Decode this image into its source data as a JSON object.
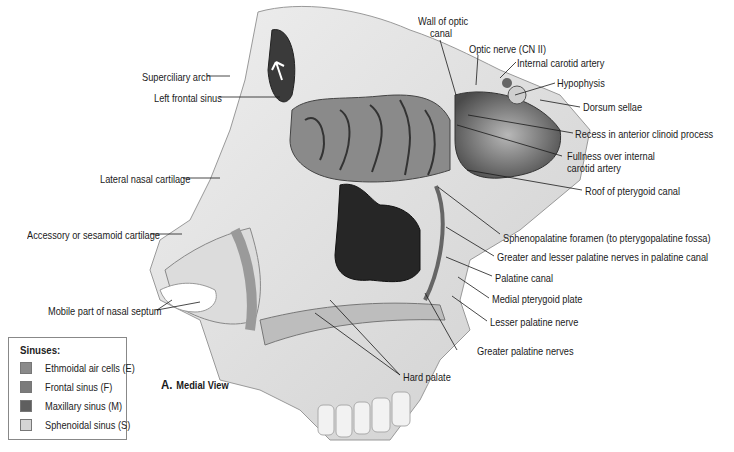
{
  "figure": {
    "view_letter": "A.",
    "view_title": "Medial View"
  },
  "legend": {
    "title": "Sinuses:",
    "items": [
      {
        "label": "Ethmoidal air cells (E)",
        "color": "#8a8a8a"
      },
      {
        "label": "Frontal sinus (F)",
        "color": "#7b7b7b"
      },
      {
        "label": "Maxillary sinus (M)",
        "color": "#5f5f5f"
      },
      {
        "label": "Sphenoidal sinus (S)",
        "color": "#d4d4d4"
      }
    ]
  },
  "labels": {
    "left": [
      {
        "text": "Superciliary arch"
      },
      {
        "text": "Left frontal sinus"
      },
      {
        "text": "Lateral nasal cartilage"
      },
      {
        "text": "Accessory or sesamoid cartilage"
      },
      {
        "text": "Mobile part of nasal septum"
      }
    ],
    "top": [
      {
        "text_line1": "Wall of optic",
        "text_line2": "canal"
      },
      {
        "text": "Optic nerve (CN II)"
      },
      {
        "text": "Internal carotid artery"
      },
      {
        "text": "Hypophysis"
      },
      {
        "text": "Dorsum sellae"
      }
    ],
    "right": [
      {
        "text": "Recess in anterior clinoid process"
      },
      {
        "text_line1": "Fullness over internal",
        "text_line2": "carotid artery"
      },
      {
        "text": "Roof of pterygoid canal"
      },
      {
        "text": "Sphenopalatine foramen (to pterygopalatine fossa)"
      },
      {
        "text": "Greater and lesser palatine nerves in palatine canal"
      },
      {
        "text": "Palatine canal"
      },
      {
        "text": "Medial pterygoid plate"
      },
      {
        "text": "Lesser palatine nerve"
      },
      {
        "text": "Greater palatine nerves"
      }
    ],
    "bottom": [
      {
        "text": "Hard palate"
      }
    ]
  }
}
